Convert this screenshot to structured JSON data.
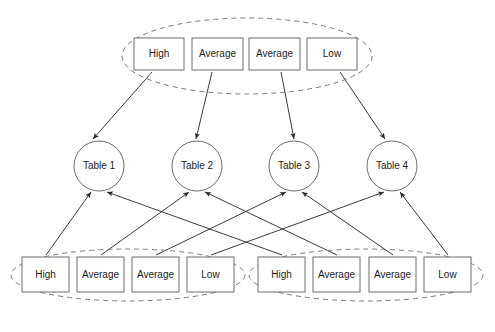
{
  "diagram": {
    "colors": {
      "node_stroke": "#6d6d6d",
      "group_stroke": "#7a7a7a",
      "edge_stroke": "#3b3b3b",
      "text": "#1c1c1c",
      "background": "#ffffff"
    },
    "groups": [
      {
        "id": "top-group",
        "name": "top-partition-group",
        "ellipse": {
          "cx": 247,
          "cy": 56,
          "rx": 125,
          "ry": 38
        },
        "nodes": [
          {
            "id": "top-1",
            "label": "High",
            "x": 134,
            "y": 38,
            "w": 50,
            "h": 32
          },
          {
            "id": "top-2",
            "label": "Average",
            "x": 192,
            "y": 38,
            "w": 51,
            "h": 32
          },
          {
            "id": "top-3",
            "label": "Average",
            "x": 249,
            "y": 38,
            "w": 51,
            "h": 32
          },
          {
            "id": "top-4",
            "label": "Low",
            "x": 307,
            "y": 38,
            "w": 50,
            "h": 32
          }
        ]
      },
      {
        "id": "bottom-left-group",
        "name": "bottom-left-partition-group",
        "ellipse": {
          "cx": 128,
          "cy": 275,
          "rx": 117,
          "ry": 26
        },
        "nodes": [
          {
            "id": "bl-1",
            "label": "High",
            "x": 22,
            "y": 257,
            "w": 47,
            "h": 35
          },
          {
            "id": "bl-2",
            "label": "Average",
            "x": 77,
            "y": 257,
            "w": 47,
            "h": 35
          },
          {
            "id": "bl-3",
            "label": "Average",
            "x": 132,
            "y": 257,
            "w": 47,
            "h": 35
          },
          {
            "id": "bl-4",
            "label": "Low",
            "x": 187,
            "y": 257,
            "w": 47,
            "h": 35
          }
        ]
      },
      {
        "id": "bottom-right-group",
        "name": "bottom-right-partition-group",
        "ellipse": {
          "cx": 366,
          "cy": 275,
          "rx": 117,
          "ry": 26
        },
        "nodes": [
          {
            "id": "br-1",
            "label": "High",
            "x": 258,
            "y": 257,
            "w": 47,
            "h": 35
          },
          {
            "id": "br-2",
            "label": "Average",
            "x": 313,
            "y": 257,
            "w": 47,
            "h": 35
          },
          {
            "id": "br-3",
            "label": "Average",
            "x": 369,
            "y": 257,
            "w": 47,
            "h": 35
          },
          {
            "id": "br-4",
            "label": "Low",
            "x": 424,
            "y": 257,
            "w": 47,
            "h": 35
          }
        ]
      }
    ],
    "tables": [
      {
        "id": "table-1",
        "label": "Table 1",
        "cx": 99,
        "cy": 166,
        "r": 25
      },
      {
        "id": "table-2",
        "label": "Table 2",
        "cx": 197,
        "cy": 166,
        "r": 25
      },
      {
        "id": "table-3",
        "label": "Table 3",
        "cx": 294,
        "cy": 166,
        "r": 25
      },
      {
        "id": "table-4",
        "label": "Table 4",
        "cx": 392,
        "cy": 166,
        "r": 25
      }
    ],
    "edges": [
      {
        "id": "e-top-1",
        "from": "top-1",
        "to": "table-1",
        "x1": 152,
        "y1": 72,
        "x2": 93,
        "y2": 139
      },
      {
        "id": "e-top-2",
        "from": "top-2",
        "to": "table-2",
        "x1": 212,
        "y1": 72,
        "x2": 196,
        "y2": 139
      },
      {
        "id": "e-top-3",
        "from": "top-3",
        "to": "table-3",
        "x1": 281,
        "y1": 72,
        "x2": 294,
        "y2": 139
      },
      {
        "id": "e-top-4",
        "from": "top-4",
        "to": "table-4",
        "x1": 340,
        "y1": 72,
        "x2": 385,
        "y2": 139
      },
      {
        "id": "e-bl-1",
        "from": "bl-1",
        "to": "table-1",
        "x1": 46,
        "y1": 255,
        "x2": 91,
        "y2": 192
      },
      {
        "id": "e-bl-2",
        "from": "bl-2",
        "to": "table-2",
        "x1": 101,
        "y1": 255,
        "x2": 189,
        "y2": 192
      },
      {
        "id": "e-bl-3",
        "from": "bl-3",
        "to": "table-3",
        "x1": 156,
        "y1": 255,
        "x2": 286,
        "y2": 192
      },
      {
        "id": "e-bl-4",
        "from": "bl-4",
        "to": "table-4",
        "x1": 211,
        "y1": 255,
        "x2": 384,
        "y2": 192
      },
      {
        "id": "e-br-1",
        "from": "br-1",
        "to": "table-1",
        "x1": 282,
        "y1": 255,
        "x2": 107,
        "y2": 192
      },
      {
        "id": "e-br-2",
        "from": "br-2",
        "to": "table-2",
        "x1": 337,
        "y1": 255,
        "x2": 205,
        "y2": 192
      },
      {
        "id": "e-br-3",
        "from": "br-3",
        "to": "table-3",
        "x1": 393,
        "y1": 255,
        "x2": 302,
        "y2": 192
      },
      {
        "id": "e-br-4",
        "from": "br-4",
        "to": "table-4",
        "x1": 448,
        "y1": 255,
        "x2": 400,
        "y2": 192
      }
    ]
  }
}
